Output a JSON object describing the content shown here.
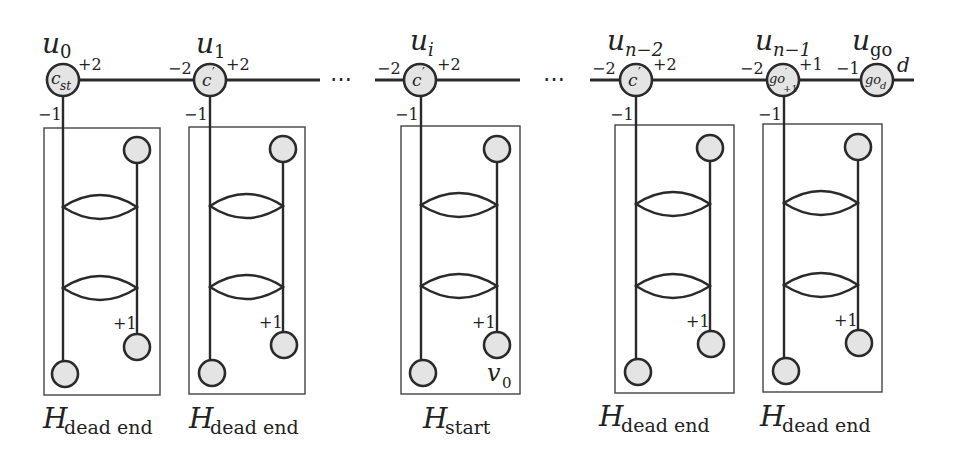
{
  "figure": {
    "type": "graph-gadget-chain",
    "main_nodes": [
      {
        "id": "u0",
        "name_base": "u",
        "name_sub": "0",
        "inner_base": "c",
        "inner_sub": "st",
        "inner_sup": "",
        "left_weight": "",
        "right_weight": "+2",
        "down_weight": "−1"
      },
      {
        "id": "u1",
        "name_base": "u",
        "name_sub": "1",
        "inner_base": "c",
        "inner_sub": "",
        "inner_sup": "′",
        "left_weight": "−2",
        "right_weight": "+2",
        "down_weight": "−1"
      },
      {
        "id": "ui",
        "name_base": "u",
        "name_sub": "i",
        "inner_base": "c",
        "inner_sub": "",
        "inner_sup": "′",
        "left_weight": "−2",
        "right_weight": "+2",
        "down_weight": "−1"
      },
      {
        "id": "un2",
        "name_base": "u",
        "name_sub": "n−2",
        "inner_base": "c",
        "inner_sub": "",
        "inner_sup": "′",
        "left_weight": "−2",
        "right_weight": "+2",
        "down_weight": "−1"
      },
      {
        "id": "un1",
        "name_base": "u",
        "name_sub": "n−1",
        "inner_base": "go",
        "inner_sub": "+1",
        "inner_sup": "′",
        "left_weight": "−2",
        "right_weight": "+1",
        "down_weight": "−1"
      },
      {
        "id": "ugo",
        "name_base": "u",
        "name_sub": "go",
        "inner_base": "go",
        "inner_sub": "d",
        "inner_sup": "",
        "left_weight": "−1",
        "right_weight": "d",
        "down_weight": ""
      }
    ],
    "ellipses": [
      "⋯",
      "⋯"
    ],
    "gadgets": [
      {
        "label_base": "H",
        "label_sub": "dead end",
        "inner_weight": "+1",
        "node_label": ""
      },
      {
        "label_base": "H",
        "label_sub": "dead end",
        "inner_weight": "+1",
        "node_label": ""
      },
      {
        "label_base": "H",
        "label_sub": "start",
        "inner_weight": "+1",
        "node_label_base": "v",
        "node_label_sub": "0"
      },
      {
        "label_base": "H",
        "label_sub": "dead end",
        "inner_weight": "+1",
        "node_label": ""
      },
      {
        "label_base": "H",
        "label_sub": "dead end",
        "inner_weight": "+1",
        "node_label": ""
      }
    ],
    "colors": {
      "node_fill": "#e4e4e4",
      "stroke": "#2a2a2a",
      "background": "#ffffff"
    }
  }
}
